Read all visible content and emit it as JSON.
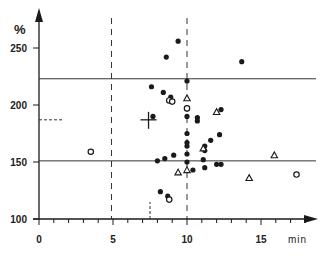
{
  "chart_data": {
    "type": "scatter",
    "title": "",
    "xlabel": "min",
    "ylabel": "%",
    "xlim": [
      0,
      19
    ],
    "ylim": [
      100,
      265
    ],
    "x_ticks": [
      0,
      5,
      10,
      15
    ],
    "y_ticks": [
      100,
      150,
      200,
      250
    ],
    "reference_lines": {
      "horizontal_solid": [
        223,
        151
      ],
      "vertical_dashed": [
        4.9,
        10.0
      ],
      "short_dashed_vertical": {
        "x": 7.5,
        "y_from": 100,
        "y_to": 115
      },
      "short_dashed_horizontal": {
        "y": 187,
        "x_from": 0,
        "x_to": 1.6
      }
    },
    "mean_marker": {
      "x": 7.4,
      "y": 187
    },
    "series": [
      {
        "name": "filled circles",
        "marker": "filled-circle",
        "points": [
          [
            9.4,
            256
          ],
          [
            8.6,
            242
          ],
          [
            13.7,
            238
          ],
          [
            10.0,
            221
          ],
          [
            7.6,
            216
          ],
          [
            8.4,
            211
          ],
          [
            8.9,
            207
          ],
          [
            10.0,
            190
          ],
          [
            10.7,
            189
          ],
          [
            10.7,
            186
          ],
          [
            12.3,
            196
          ],
          [
            12.2,
            174
          ],
          [
            11.2,
            164
          ],
          [
            11.2,
            160
          ],
          [
            10.0,
            167
          ],
          [
            10.0,
            164
          ],
          [
            11.6,
            169
          ],
          [
            10.0,
            157
          ],
          [
            9.1,
            156
          ],
          [
            8.5,
            153
          ],
          [
            8.0,
            151
          ],
          [
            11.1,
            152
          ],
          [
            10.0,
            150
          ],
          [
            12.0,
            148
          ],
          [
            11.2,
            145
          ],
          [
            12.3,
            148
          ],
          [
            10.4,
            143
          ],
          [
            8.2,
            124
          ],
          [
            7.7,
            190
          ],
          [
            8.7,
            120
          ],
          [
            10.0,
            175
          ]
        ]
      },
      {
        "name": "open circles",
        "marker": "open-circle",
        "points": [
          [
            8.8,
            204
          ],
          [
            9.0,
            203
          ],
          [
            10.0,
            197
          ],
          [
            3.5,
            159
          ],
          [
            17.4,
            139
          ],
          [
            8.8,
            117
          ]
        ]
      },
      {
        "name": "open triangles",
        "marker": "open-triangle",
        "points": [
          [
            10.0,
            206
          ],
          [
            12.0,
            194
          ],
          [
            11.1,
            162
          ],
          [
            15.9,
            156
          ],
          [
            14.2,
            136
          ],
          [
            9.4,
            141
          ],
          [
            10.0,
            143
          ]
        ]
      }
    ]
  },
  "axes": {
    "y_unit": "%",
    "x_unit": "min",
    "y_tick_labels": [
      "100",
      "150",
      "200",
      "250"
    ],
    "x_tick_labels": [
      "0",
      "5",
      "10",
      "15"
    ]
  }
}
